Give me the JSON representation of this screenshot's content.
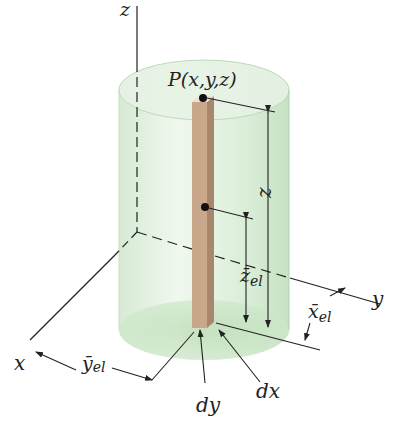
{
  "figure": {
    "colors": {
      "cylinder_fill": "#d6ecd4",
      "cylinder_edge": "#b9d8b6",
      "element_front": "#c9a78b",
      "element_side": "#a9876c",
      "element_top": "#e9dccc",
      "line": "#222222"
    },
    "labels": {
      "z_axis": "z",
      "y_axis": "y",
      "x_axis": "x",
      "point": "P(x,y,z)",
      "height": "z",
      "z_el": "z̄",
      "z_el_sub": "el",
      "x_el": "x̄",
      "x_el_sub": "el",
      "y_el": "ȳ",
      "y_el_sub": "el",
      "dx": "dx",
      "dy": "dy"
    }
  }
}
